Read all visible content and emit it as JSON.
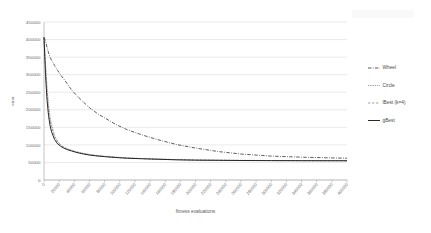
{
  "chart_data": {
    "type": "line",
    "title": "",
    "xlabel": "fitness evaluations",
    "ylabel": "error",
    "xlim": [
      0,
      400000
    ],
    "ylim": [
      0,
      450000
    ],
    "grid": true,
    "legend_position": "right",
    "y_ticks": [
      0,
      50000,
      100000,
      150000,
      200000,
      250000,
      300000,
      350000,
      400000,
      450000
    ],
    "y_tick_labels": [
      "0",
      "50000",
      "100000",
      "150000",
      "200000",
      "250000",
      "300000",
      "350000",
      "400000",
      "450000"
    ],
    "x_ticks": [
      0,
      20000,
      40000,
      60000,
      80000,
      100000,
      120000,
      140000,
      160000,
      180000,
      200000,
      220000,
      240000,
      260000,
      280000,
      300000,
      320000,
      340000,
      360000,
      380000,
      400000
    ],
    "x_tick_labels": [
      "0",
      "20000",
      "40000",
      "60000",
      "80000",
      "100000",
      "120000",
      "140000",
      "160000",
      "180000",
      "200000",
      "220000",
      "240000",
      "260000",
      "280000",
      "300000",
      "320000",
      "340000",
      "360000",
      "380000",
      "400000"
    ],
    "x": [
      0,
      2000,
      4000,
      6000,
      8000,
      10000,
      14000,
      18000,
      22000,
      26000,
      30000,
      36000,
      42000,
      50000,
      60000,
      70000,
      80000,
      95000,
      110000,
      130000,
      150000,
      175000,
      200000,
      230000,
      260000,
      300000,
      340000,
      400000
    ],
    "series": [
      {
        "name": "Wheel",
        "style": "dash-dot",
        "color": "#3d3d3d",
        "values": [
          406000,
          396000,
          378000,
          362000,
          350000,
          341000,
          326000,
          312000,
          299000,
          288000,
          276000,
          258000,
          243000,
          226000,
          206000,
          190000,
          177000,
          158000,
          143000,
          128000,
          115000,
          101000,
          91000,
          81000,
          74000,
          68000,
          65000,
          62000
        ]
      },
      {
        "name": "Circle",
        "style": "dotted",
        "color": "#5a5a5a",
        "values": [
          406000,
          330000,
          262000,
          213000,
          180000,
          158000,
          127000,
          110000,
          100000,
          94000,
          90000,
          85000,
          81000,
          77000,
          73000,
          70000,
          68000,
          65000,
          63000,
          61000,
          60000,
          58000,
          57000,
          56500,
          56000,
          55500,
          55200,
          55000
        ]
      },
      {
        "name": "lBest (k=4)",
        "style": "dashed-light",
        "color": "#8a8a8a",
        "values": [
          406000,
          322000,
          251000,
          202000,
          170000,
          149000,
          122000,
          108000,
          99000,
          93000,
          89000,
          84000,
          80000,
          76000,
          72000,
          69000,
          67000,
          64500,
          62500,
          61000,
          59500,
          58000,
          57000,
          56300,
          55800,
          55400,
          55100,
          55000
        ]
      },
      {
        "name": "gBest",
        "style": "solid",
        "color": "#1f1f1f",
        "values": [
          406000,
          300000,
          228000,
          183000,
          155000,
          137000,
          115000,
          103000,
          96000,
          91000,
          87000,
          83000,
          79000,
          75000,
          71000,
          68500,
          66500,
          64000,
          62000,
          60500,
          59000,
          57500,
          56500,
          56000,
          55500,
          55200,
          55000,
          54800
        ]
      }
    ]
  }
}
